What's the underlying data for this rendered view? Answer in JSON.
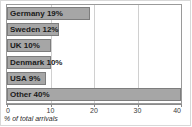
{
  "chart_data": {
    "type": "bar",
    "orientation": "horizontal",
    "title": "",
    "xlabel": "% of total arrivals",
    "ylabel": "",
    "categories": [
      "Germany",
      "Sweden",
      "UK",
      "Denmark",
      "USA",
      "Other"
    ],
    "values": [
      19,
      12,
      10,
      10,
      9,
      40
    ],
    "bar_labels": [
      "Germany 19%",
      "Sweden 12%",
      "UK 10%",
      "Denmark 10%",
      "USA 9%",
      "Other 40%"
    ],
    "xlim": [
      0,
      40
    ],
    "xticks": [
      0,
      10,
      20,
      30,
      40
    ],
    "xtick_labels": [
      "0",
      "10",
      "20",
      "30",
      "40"
    ],
    "grid": true,
    "legend": "none",
    "colors": {
      "bar_fill": "#a6a6a6",
      "bar_border": "#7d7d7d",
      "plot_border": "#9a9a9a",
      "gridline": "#d0d0d0",
      "label_text": "#1a1a1a",
      "background": "#ffffff"
    }
  }
}
